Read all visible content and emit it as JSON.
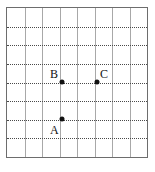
{
  "figure": {
    "title": "",
    "kind": "coordinate-grid-with-labeled-points",
    "grid": {
      "columns": 8,
      "rows": 8,
      "vertical_line_style": "solid",
      "horizontal_line_style": "dotted",
      "border_color": "#6d6d6d",
      "vertical_line_color": "#a8a8a8",
      "horizontal_line_color": "#4a4a4a",
      "background_color": "#ffffff",
      "cell_width": 17.75,
      "cell_height": 18.875
    },
    "points": [
      {
        "label": "B",
        "grid_x": 3,
        "grid_y": 4,
        "px_x": 62,
        "px_y": 82,
        "label_position": "above-left",
        "label_px_x": 50,
        "label_px_y": 68,
        "dot_color": "#111111"
      },
      {
        "label": "C",
        "grid_x": 5,
        "grid_y": 4,
        "px_x": 97,
        "px_y": 82,
        "label_position": "above-right",
        "label_px_x": 100,
        "label_px_y": 68,
        "dot_color": "#111111"
      },
      {
        "label": "A",
        "grid_x": 3,
        "grid_y": 6,
        "px_x": 62,
        "px_y": 119,
        "label_position": "below-left",
        "label_px_x": 50,
        "label_px_y": 124,
        "dot_color": "#111111"
      }
    ]
  }
}
